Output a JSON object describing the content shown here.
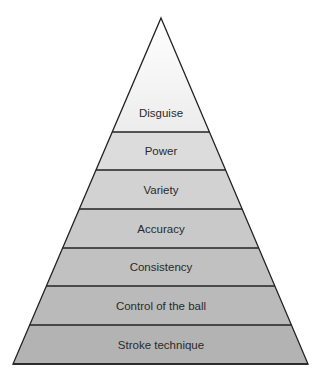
{
  "diagram": {
    "type": "pyramid",
    "apex": [
      161,
      18
    ],
    "base_left": [
      13,
      364
    ],
    "base_right": [
      308,
      364
    ],
    "boundaries_y": [
      132,
      170,
      209,
      248,
      286,
      325,
      364
    ],
    "levels": [
      {
        "label": "Disguise",
        "fill": "#e9e9e9"
      },
      {
        "label": "Power",
        "fill": "#dcdcdc"
      },
      {
        "label": "Variety",
        "fill": "#d2d2d2"
      },
      {
        "label": "Accuracy",
        "fill": "#c9c9c9"
      },
      {
        "label": "Consistency",
        "fill": "#c1c1c1"
      },
      {
        "label": "Control of the ball",
        "fill": "#bababa"
      },
      {
        "label": "Stroke technique",
        "fill": "#b3b3b3"
      }
    ],
    "top_fill": "#f5f5f5",
    "line_color": "#222222"
  }
}
